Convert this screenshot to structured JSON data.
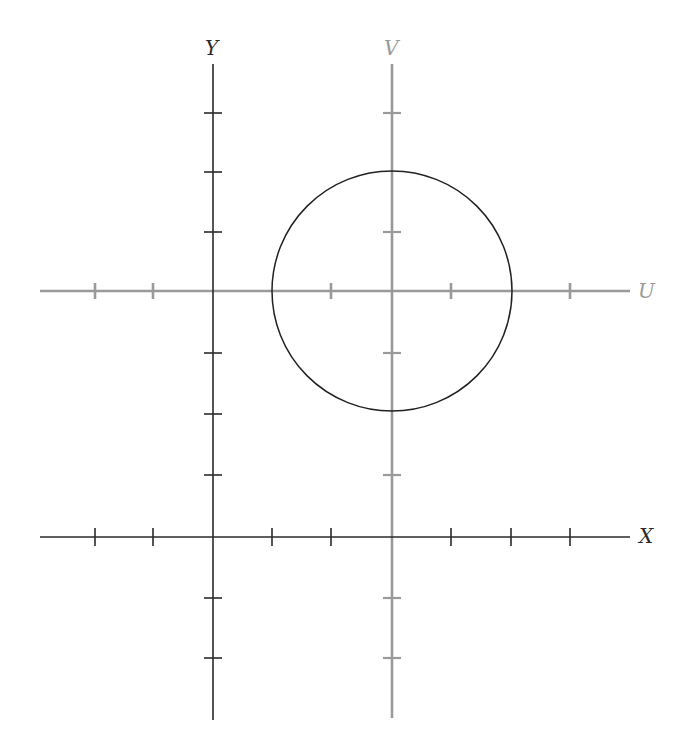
{
  "diagram": {
    "type": "coordinate-systems",
    "colors": {
      "xy_axes": "#2a2a2a",
      "uv_axes": "#9a9a9a",
      "circle": "#222222",
      "background": "#ffffff"
    },
    "labels": {
      "x_axis": "X",
      "y_axis": "Y",
      "u_axis": "U",
      "v_axis": "V"
    },
    "xy_system": {
      "origin_px": [
        213,
        537
      ],
      "x_axis": {
        "from": 40,
        "to": 630,
        "ticks": [
          95,
          153,
          272,
          331,
          451,
          511,
          570
        ]
      },
      "y_axis": {
        "from": 64,
        "to": 720,
        "ticks": [
          113,
          172,
          232,
          291,
          353,
          414,
          475,
          598,
          658
        ]
      }
    },
    "uv_system": {
      "origin_px": [
        392,
        291
      ],
      "origin_in_xy_units": [
        3,
        4
      ],
      "u_axis": {
        "from": 40,
        "to": 630,
        "ticks": [
          95,
          153,
          331,
          451,
          570
        ]
      },
      "v_axis": {
        "from": 64,
        "to": 718,
        "ticks": [
          113,
          232,
          353,
          475,
          598,
          658
        ]
      }
    },
    "circle": {
      "center_px": [
        392,
        291
      ],
      "radius_px": 120,
      "center_uv": [
        0,
        0
      ],
      "radius_units": 2
    },
    "unit_px": 59.6
  }
}
